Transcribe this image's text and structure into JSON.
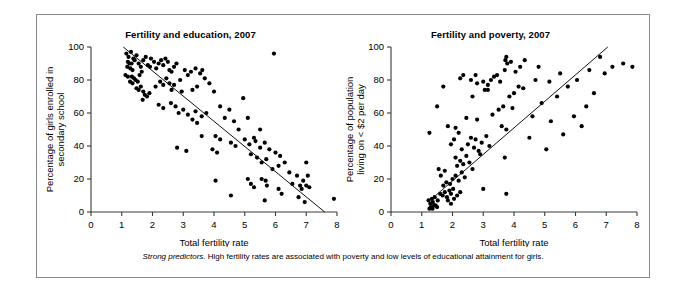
{
  "figure": {
    "caption_lead": "Strong predictors.",
    "caption_rest": " High fertility rates are associated with poverty and low levels of educational attainment for girls."
  },
  "chart_data": [
    {
      "type": "scatter",
      "id": "fertility-education",
      "title": "Fertility and education, 2007",
      "xlabel": "Total fertility rate",
      "ylabel": "Percentage of girls enrolled in secondary school",
      "ylabel_lines": [
        "Percentage of girls enrolled in",
        "secondary school"
      ],
      "xlim": [
        0,
        8
      ],
      "ylim": [
        0,
        100
      ],
      "xticks": [
        0,
        1,
        2,
        3,
        4,
        5,
        6,
        7,
        8
      ],
      "yticks": [
        0,
        20,
        40,
        60,
        80,
        100
      ],
      "grid": false,
      "legend": "none",
      "trend": {
        "x0": 1.05,
        "y0": 100.0,
        "x1": 7.6,
        "y1": 0.0
      },
      "points": [
        [
          1.15,
          96
        ],
        [
          1.22,
          94
        ],
        [
          1.3,
          97
        ],
        [
          1.38,
          93
        ],
        [
          1.2,
          91
        ],
        [
          1.25,
          90
        ],
        [
          1.32,
          90
        ],
        [
          1.18,
          88
        ],
        [
          1.28,
          87
        ],
        [
          1.35,
          86
        ],
        [
          1.42,
          92
        ],
        [
          1.48,
          95
        ],
        [
          1.55,
          90
        ],
        [
          1.62,
          88
        ],
        [
          1.12,
          83
        ],
        [
          1.2,
          82
        ],
        [
          1.33,
          82
        ],
        [
          1.4,
          81
        ],
        [
          1.27,
          79
        ],
        [
          1.35,
          78
        ],
        [
          1.45,
          80
        ],
        [
          1.52,
          79
        ],
        [
          1.58,
          83
        ],
        [
          1.65,
          85
        ],
        [
          1.7,
          92
        ],
        [
          1.78,
          94
        ],
        [
          1.85,
          89
        ],
        [
          1.92,
          88
        ],
        [
          1.95,
          93
        ],
        [
          2.05,
          91
        ],
        [
          2.12,
          87
        ],
        [
          2.2,
          90
        ],
        [
          2.28,
          92
        ],
        [
          2.35,
          89
        ],
        [
          2.42,
          93
        ],
        [
          2.5,
          91
        ],
        [
          2.55,
          86
        ],
        [
          2.62,
          85
        ],
        [
          2.7,
          88
        ],
        [
          2.78,
          90
        ],
        [
          1.48,
          75
        ],
        [
          1.55,
          74
        ],
        [
          1.62,
          76
        ],
        [
          1.7,
          73
        ],
        [
          1.75,
          71
        ],
        [
          1.82,
          70
        ],
        [
          1.9,
          72
        ],
        [
          1.68,
          68
        ],
        [
          2.1,
          76
        ],
        [
          2.25,
          79
        ],
        [
          2.35,
          77
        ],
        [
          2.45,
          81
        ],
        [
          2.55,
          78
        ],
        [
          2.62,
          74
        ],
        [
          2.7,
          77
        ],
        [
          2.9,
          80
        ],
        [
          3.05,
          86
        ],
        [
          3.15,
          83
        ],
        [
          3.25,
          85
        ],
        [
          3.4,
          87
        ],
        [
          3.55,
          84
        ],
        [
          3.62,
          86
        ],
        [
          3.7,
          81
        ],
        [
          2.95,
          73
        ],
        [
          3.3,
          74
        ],
        [
          3.45,
          76
        ],
        [
          3.85,
          78
        ],
        [
          4.0,
          73
        ],
        [
          2.2,
          65
        ],
        [
          2.35,
          63
        ],
        [
          2.6,
          66
        ],
        [
          2.75,
          64
        ],
        [
          2.85,
          60
        ],
        [
          3.0,
          62
        ],
        [
          3.15,
          59
        ],
        [
          3.4,
          61
        ],
        [
          3.3,
          56
        ],
        [
          3.45,
          54
        ],
        [
          3.6,
          58
        ],
        [
          3.75,
          60
        ],
        [
          4.2,
          64
        ],
        [
          4.35,
          57
        ],
        [
          4.5,
          62
        ],
        [
          4.65,
          55
        ],
        [
          5.1,
          57
        ],
        [
          5.3,
          45
        ],
        [
          4.05,
          46
        ],
        [
          4.2,
          44
        ],
        [
          4.55,
          42
        ],
        [
          4.7,
          40
        ],
        [
          3.95,
          38
        ],
        [
          4.1,
          36
        ],
        [
          2.8,
          39
        ],
        [
          3.1,
          37
        ],
        [
          5.0,
          44
        ],
        [
          5.15,
          41
        ],
        [
          5.35,
          43
        ],
        [
          5.5,
          39
        ],
        [
          5.65,
          42
        ],
        [
          5.8,
          38
        ],
        [
          5.2,
          35
        ],
        [
          5.4,
          33
        ],
        [
          5.55,
          30
        ],
        [
          5.7,
          32
        ],
        [
          6.0,
          36
        ],
        [
          6.15,
          34
        ],
        [
          6.3,
          30
        ],
        [
          6.1,
          28
        ],
        [
          4.05,
          19
        ],
        [
          4.55,
          10
        ],
        [
          5.1,
          20
        ],
        [
          5.2,
          17
        ],
        [
          5.3,
          15
        ],
        [
          5.55,
          20
        ],
        [
          5.68,
          19
        ],
        [
          5.72,
          16
        ],
        [
          5.65,
          7
        ],
        [
          6.1,
          14
        ],
        [
          6.2,
          11
        ],
        [
          6.55,
          17
        ],
        [
          6.7,
          22
        ],
        [
          6.8,
          16
        ],
        [
          6.85,
          14
        ],
        [
          6.9,
          19
        ],
        [
          7.0,
          16
        ],
        [
          7.05,
          22
        ],
        [
          7.1,
          15
        ],
        [
          6.75,
          9
        ],
        [
          6.95,
          6
        ],
        [
          7.9,
          8
        ],
        [
          7.0,
          30
        ],
        [
          6.45,
          24
        ],
        [
          5.9,
          26
        ],
        [
          5.5,
          50
        ],
        [
          4.8,
          50
        ],
        [
          3.6,
          46
        ],
        [
          5.95,
          96
        ],
        [
          4.95,
          69
        ]
      ]
    },
    {
      "type": "scatter",
      "id": "fertility-poverty",
      "title": "Fertility and poverty, 2007",
      "xlabel": "Total fertility rate",
      "ylabel": "Percentage of population living on < $2 per day",
      "ylabel_lines": [
        "Percentage of population",
        "living on < $2 per day"
      ],
      "xlim": [
        0,
        8
      ],
      "ylim": [
        0,
        100
      ],
      "xticks": [
        0,
        1,
        2,
        3,
        4,
        5,
        6,
        7,
        8
      ],
      "yticks": [
        0,
        20,
        40,
        60,
        80,
        100
      ],
      "grid": false,
      "legend": "none",
      "trend": {
        "x0": 1.45,
        "y0": 10.0,
        "x1": 7.05,
        "y1": 100.0
      },
      "points": [
        [
          1.25,
          2
        ],
        [
          1.3,
          3
        ],
        [
          1.35,
          2
        ],
        [
          1.4,
          4
        ],
        [
          1.28,
          5
        ],
        [
          1.36,
          6
        ],
        [
          1.45,
          4
        ],
        [
          1.5,
          3
        ],
        [
          1.22,
          7
        ],
        [
          1.33,
          8
        ],
        [
          1.42,
          9
        ],
        [
          1.52,
          7
        ],
        [
          1.6,
          11
        ],
        [
          1.68,
          10
        ],
        [
          1.75,
          12
        ],
        [
          1.82,
          9
        ],
        [
          1.9,
          13
        ],
        [
          1.95,
          11
        ],
        [
          2.02,
          14
        ],
        [
          1.85,
          7
        ],
        [
          1.95,
          5
        ],
        [
          2.05,
          8
        ],
        [
          2.15,
          10
        ],
        [
          2.25,
          12
        ],
        [
          1.7,
          16
        ],
        [
          1.8,
          18
        ],
        [
          1.92,
          17
        ],
        [
          2.0,
          20
        ],
        [
          2.1,
          22
        ],
        [
          2.2,
          19
        ],
        [
          2.3,
          24
        ],
        [
          2.4,
          21
        ],
        [
          1.62,
          22
        ],
        [
          1.55,
          26
        ],
        [
          1.75,
          25
        ],
        [
          2.15,
          28
        ],
        [
          2.25,
          31
        ],
        [
          2.35,
          29
        ],
        [
          2.1,
          33
        ],
        [
          2.45,
          34
        ],
        [
          2.55,
          30
        ],
        [
          2.65,
          26
        ],
        [
          2.3,
          38
        ],
        [
          2.5,
          41
        ],
        [
          2.7,
          39
        ],
        [
          2.85,
          37
        ],
        [
          2.6,
          45
        ],
        [
          2.75,
          44
        ],
        [
          2.95,
          42
        ],
        [
          3.1,
          46
        ],
        [
          3.2,
          40
        ],
        [
          2.9,
          35
        ],
        [
          1.95,
          41
        ],
        [
          2.05,
          44
        ],
        [
          2.2,
          48
        ],
        [
          2.1,
          51
        ],
        [
          1.85,
          52
        ],
        [
          2.45,
          57
        ],
        [
          2.8,
          56
        ],
        [
          1.5,
          64
        ],
        [
          1.7,
          76
        ],
        [
          2.25,
          81
        ],
        [
          2.35,
          83
        ],
        [
          2.6,
          80
        ],
        [
          2.75,
          83
        ],
        [
          2.65,
          70
        ],
        [
          2.8,
          78
        ],
        [
          1.25,
          48
        ],
        [
          3.0,
          79
        ],
        [
          3.15,
          77
        ],
        [
          3.25,
          80
        ],
        [
          3.05,
          74
        ],
        [
          3.15,
          74
        ],
        [
          3.35,
          82
        ],
        [
          3.45,
          83
        ],
        [
          3.55,
          79
        ],
        [
          3.7,
          86
        ],
        [
          3.72,
          92
        ],
        [
          3.75,
          94
        ],
        [
          3.78,
          90
        ],
        [
          3.9,
          91
        ],
        [
          4.05,
          85
        ],
        [
          4.2,
          88
        ],
        [
          4.35,
          92
        ],
        [
          4.8,
          88
        ],
        [
          4.15,
          76
        ],
        [
          4.3,
          75
        ],
        [
          4.0,
          72
        ],
        [
          3.85,
          70
        ],
        [
          3.65,
          64
        ],
        [
          3.95,
          63
        ],
        [
          3.5,
          62
        ],
        [
          3.3,
          59
        ],
        [
          3.6,
          52
        ],
        [
          3.75,
          50
        ],
        [
          4.5,
          45
        ],
        [
          5.05,
          38
        ],
        [
          3.7,
          33
        ],
        [
          3.0,
          14
        ],
        [
          3.75,
          11
        ],
        [
          5.95,
          58
        ],
        [
          6.35,
          64
        ],
        [
          6.6,
          72
        ],
        [
          6.95,
          84
        ],
        [
          7.2,
          88
        ],
        [
          7.55,
          90
        ],
        [
          7.85,
          88
        ],
        [
          6.2,
          52
        ],
        [
          5.6,
          47
        ],
        [
          5.2,
          55
        ],
        [
          4.6,
          58
        ],
        [
          4.9,
          66
        ],
        [
          5.4,
          70
        ],
        [
          5.75,
          76
        ],
        [
          6.05,
          80
        ],
        [
          6.45,
          86
        ],
        [
          5.5,
          84
        ],
        [
          5.15,
          79
        ],
        [
          4.7,
          80
        ],
        [
          6.8,
          94
        ]
      ]
    }
  ]
}
